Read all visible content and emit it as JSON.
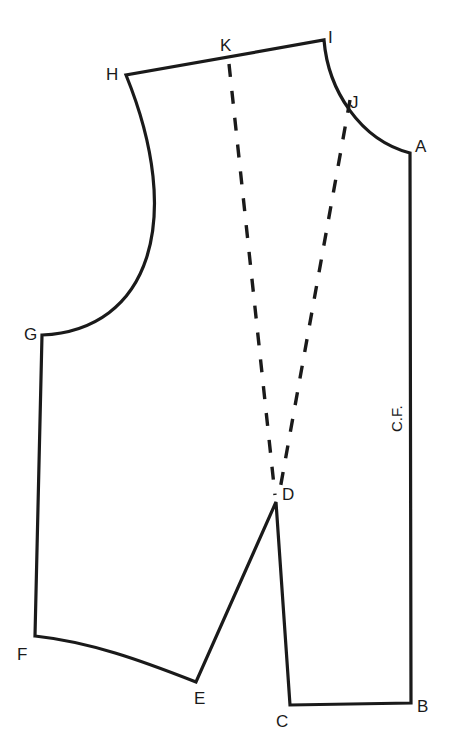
{
  "diagram": {
    "type": "sewing-pattern",
    "colors": {
      "line": "#1a1a1a",
      "background": "#ffffff"
    },
    "points": {
      "A": "A",
      "B": "B",
      "C": "C",
      "D": "D",
      "E": "E",
      "F": "F",
      "G": "G",
      "H": "H",
      "I": "I",
      "J": "J",
      "K": "K"
    },
    "center_front_label": "C.F.",
    "lines": [
      {
        "from": "A",
        "to": "B",
        "style": "solid",
        "desc": "center front edge"
      },
      {
        "from": "B",
        "to": "C",
        "style": "solid",
        "desc": "waistline"
      },
      {
        "from": "C",
        "to": "D",
        "style": "solid",
        "desc": "dart leg"
      },
      {
        "from": "D",
        "to": "E",
        "style": "solid",
        "desc": "dart leg"
      },
      {
        "from": "E",
        "to": "F",
        "style": "solid",
        "desc": "waistline"
      },
      {
        "from": "F",
        "to": "G",
        "style": "solid",
        "desc": "side seam"
      },
      {
        "from": "G",
        "to": "H",
        "style": "solid-curve",
        "desc": "armhole"
      },
      {
        "from": "H",
        "to": "I",
        "style": "solid",
        "desc": "shoulder"
      },
      {
        "from": "I",
        "to": "A",
        "style": "solid-curve",
        "desc": "neckline"
      },
      {
        "from": "K",
        "to": "D",
        "style": "dashed",
        "desc": "slash line"
      },
      {
        "from": "J",
        "to": "D",
        "style": "dashed",
        "desc": "slash line"
      }
    ]
  }
}
